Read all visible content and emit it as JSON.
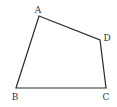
{
  "diagram": {
    "type": "quadrilateral",
    "vertices": [
      {
        "label": "A",
        "x": 39,
        "y": 16,
        "lx": 38,
        "ly": 13
      },
      {
        "label": "B",
        "x": 16,
        "y": 88,
        "lx": 15,
        "ly": 100
      },
      {
        "label": "C",
        "x": 106,
        "y": 88,
        "lx": 106,
        "ly": 100
      },
      {
        "label": "D",
        "x": 100,
        "y": 40,
        "lx": 107,
        "ly": 41
      }
    ],
    "edges": [
      [
        "A",
        "D"
      ],
      [
        "D",
        "C"
      ],
      [
        "C",
        "B"
      ],
      [
        "B",
        "A"
      ]
    ],
    "stroke_color": "#2a2a2a"
  }
}
